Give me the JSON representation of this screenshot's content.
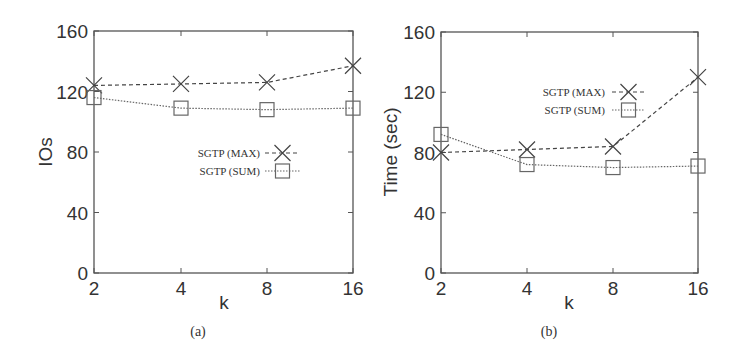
{
  "chart_data": [
    {
      "type": "line",
      "panel": "(a)",
      "caption": "(a)",
      "title": "",
      "xlabel": "k",
      "ylabel": "IOs",
      "x_ticks": [
        "2",
        "4",
        "8",
        "16"
      ],
      "categories": [
        "2",
        "4",
        "8",
        "16"
      ],
      "y_ticks": [
        0,
        40,
        80,
        120,
        160
      ],
      "ylim": [
        0,
        160
      ],
      "grid": false,
      "legend_position": "center-right inside",
      "series": [
        {
          "name": "SGTP (MAX)",
          "marker": "x",
          "line_style": "dashed",
          "values": [
            124,
            125,
            126,
            137
          ]
        },
        {
          "name": "SGTP (SUM)",
          "marker": "square",
          "line_style": "dotted",
          "values": [
            116,
            109,
            108,
            109
          ]
        }
      ]
    },
    {
      "type": "line",
      "panel": "(b)",
      "caption": "(b)",
      "title": "",
      "xlabel": "k",
      "ylabel": "Time (sec)",
      "x_ticks": [
        "2",
        "4",
        "8",
        "16"
      ],
      "categories": [
        "2",
        "4",
        "8",
        "16"
      ],
      "y_ticks": [
        0,
        40,
        80,
        120,
        160
      ],
      "ylim": [
        0,
        160
      ],
      "grid": false,
      "legend_position": "upper-center inside",
      "series": [
        {
          "name": "SGTP (MAX)",
          "marker": "x",
          "line_style": "dashed",
          "values": [
            80,
            82,
            84,
            130
          ]
        },
        {
          "name": "SGTP (SUM)",
          "marker": "square",
          "line_style": "dotted",
          "values": [
            92,
            72,
            70,
            71
          ]
        }
      ]
    }
  ],
  "colors": {
    "axis": "#555555",
    "text": "#333333",
    "series_max": "#444444",
    "series_sum": "#666666"
  }
}
